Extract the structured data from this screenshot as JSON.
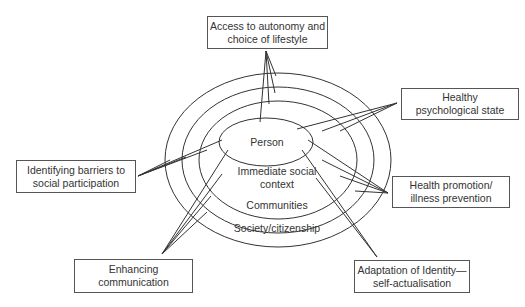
{
  "diagram": {
    "rings": [
      {
        "id": "person",
        "label_lines": [
          "Person"
        ]
      },
      {
        "id": "immediate",
        "label_lines": [
          "Immediate social",
          "context"
        ]
      },
      {
        "id": "communities",
        "label_lines": [
          "Communities"
        ]
      },
      {
        "id": "society",
        "label_lines": [
          "Society/citizenship"
        ]
      }
    ],
    "boxes": {
      "top": {
        "lines": [
          "Access to autonomy and",
          "choice of lifestyle"
        ]
      },
      "left": {
        "lines": [
          "Identifying barriers to",
          "social participation"
        ]
      },
      "right_top": {
        "lines": [
          "Healthy",
          "psychological state"
        ]
      },
      "right_mid": {
        "lines": [
          "Health promotion/",
          "illness prevention"
        ]
      },
      "bottom_left": {
        "lines": [
          "Enhancing",
          "communication"
        ]
      },
      "bottom_right": {
        "lines": [
          "Adaptation of Identity—",
          "self-actualisation"
        ]
      }
    },
    "colors": {
      "stroke": "#333333",
      "text": "#333333",
      "background": "#ffffff"
    }
  }
}
